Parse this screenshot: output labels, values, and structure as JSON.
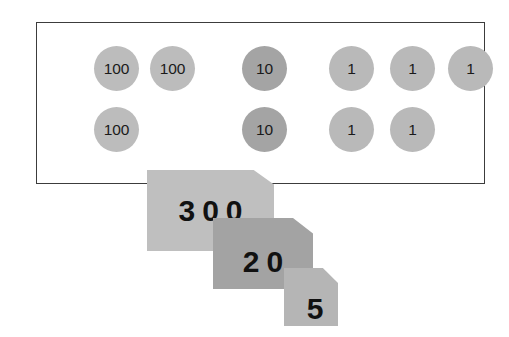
{
  "scene": {
    "title": "place-value counters and place-value cards",
    "represented_number": "325"
  },
  "counter_frame": {
    "border_color": "#3c3c3c",
    "rows": [
      {
        "row_label": "row-1",
        "counters": [
          {
            "value": "100",
            "group": "hundreds",
            "color": "#bcbcbc",
            "x": 57,
            "y": 0
          },
          {
            "value": "100",
            "group": "hundreds",
            "color": "#bcbcbc",
            "x": 113,
            "y": 0
          },
          {
            "value": "10",
            "group": "tens",
            "color": "#a4a4a4",
            "x": 205,
            "y": 0
          },
          {
            "value": "1",
            "group": "ones",
            "color": "#b9b9b9",
            "x": 292,
            "y": 0
          },
          {
            "value": "1",
            "group": "ones",
            "color": "#b9b9b9",
            "x": 353,
            "y": 0
          },
          {
            "value": "1",
            "group": "ones",
            "color": "#b9b9b9",
            "x": 411,
            "y": 0
          }
        ]
      },
      {
        "row_label": "row-2",
        "counters": [
          {
            "value": "100",
            "group": "hundreds",
            "color": "#bcbcbc",
            "x": 57,
            "y": 0
          },
          {
            "value": "10",
            "group": "tens",
            "color": "#a4a4a4",
            "x": 205,
            "y": 0
          },
          {
            "value": "1",
            "group": "ones",
            "color": "#b9b9b9",
            "x": 292,
            "y": 0
          },
          {
            "value": "1",
            "group": "ones",
            "color": "#b9b9b9",
            "x": 353,
            "y": 0
          }
        ]
      }
    ]
  },
  "place_value_cards": {
    "stack_order": [
      "hundreds",
      "tens",
      "ones"
    ],
    "cards": [
      {
        "id": "hundreds",
        "label": "300",
        "color": "#bfbfbf"
      },
      {
        "id": "tens",
        "label": "20",
        "color": "#a3a3a3"
      },
      {
        "id": "ones",
        "label": "5",
        "color": "#b5b5b5"
      }
    ]
  },
  "counts": {
    "hundreds": "3",
    "tens": "2",
    "ones": "5"
  }
}
